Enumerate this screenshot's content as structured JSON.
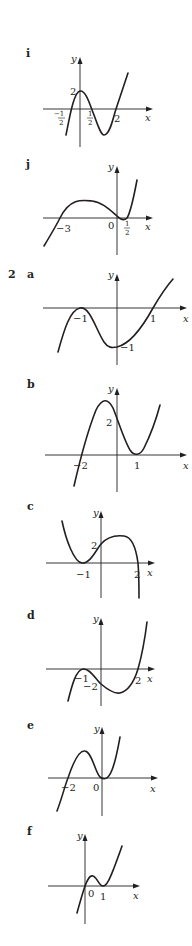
{
  "question_2_number": "2",
  "graphs": [
    {
      "id": "i",
      "label": "i",
      "x_axis_label": "x",
      "y_axis_label": "y",
      "annotations": [
        "−1/2",
        "1/2",
        "2",
        "2 (y-intercept)"
      ],
      "curve": "cubic, positive leading coefficient; roots at −1/2, 1/2, 2; y-intercept 2"
    },
    {
      "id": "j",
      "label": "j",
      "x_axis_label": "x",
      "y_axis_label": "y",
      "annotations": [
        "−3",
        "0",
        "1/2"
      ],
      "curve": "cubic, positive leading coefficient; roots at −3, 0, 1/2"
    },
    {
      "id": "2a",
      "label": "a",
      "x_axis_label": "x",
      "y_axis_label": "y",
      "annotations": [
        "−1",
        "1",
        "−1 (y-intercept)"
      ],
      "curve": "cubic; double root at −1 (touches), root at 1; y-intercept −1"
    },
    {
      "id": "2b",
      "label": "b",
      "x_axis_label": "x",
      "y_axis_label": "y",
      "annotations": [
        "−2",
        "1",
        "2 (y-intercept)"
      ],
      "curve": "cubic; root at −2, double root at 1 (touches); y-intercept 2"
    },
    {
      "id": "2c",
      "label": "c",
      "x_axis_label": "x",
      "y_axis_label": "y",
      "annotations": [
        "−1",
        "2",
        "2 (y-intercept)"
      ],
      "curve": "cubic, negative leading coefficient; double root at −1, root at 2; y-intercept 2"
    },
    {
      "id": "2d",
      "label": "d",
      "x_axis_label": "x",
      "y_axis_label": "y",
      "annotations": [
        "−1",
        "−2 (y-intercept)",
        "2"
      ],
      "curve": "cubic; double root at −1 (touches), root at 2; y-intercept −2"
    },
    {
      "id": "2e",
      "label": "e",
      "x_axis_label": "x",
      "y_axis_label": "y",
      "annotations": [
        "−2",
        "0"
      ],
      "curve": "cubic; root at −2, double root at 0 (touches)"
    },
    {
      "id": "2f",
      "label": "f",
      "x_axis_label": "x",
      "y_axis_label": "y",
      "annotations": [
        "0",
        "1"
      ],
      "curve": "cubic; root at 0, double root at 1 (touches)"
    }
  ],
  "text": {
    "i": "i",
    "j": "j",
    "a": "a",
    "b": "b",
    "c": "c",
    "d": "d",
    "e": "e",
    "f": "f",
    "x": "x",
    "y": "y",
    "neg_half_num": "−1",
    "half_num": "1",
    "den": "2",
    "two": "2",
    "neg_three": "−3",
    "zero": "0",
    "neg_one": "−1",
    "one": "1",
    "neg_two": "−2"
  }
}
